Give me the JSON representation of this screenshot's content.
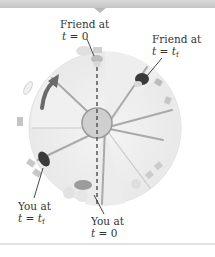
{
  "diagram": {
    "labels": {
      "friend_t0": {
        "line1": "Friend at",
        "line2_var": "t",
        "line2_eq": " = 0"
      },
      "friend_tf": {
        "line1": "Friend at",
        "line2_var": "t",
        "line2_eq": " = ",
        "line2_val": "t",
        "line2_sub": "f"
      },
      "you_tf": {
        "line1": "You at",
        "line2_var": "t",
        "line2_eq": " = ",
        "line2_val": "t",
        "line2_sub": "f"
      },
      "you_t0": {
        "line1": "You at",
        "line2_var": "t",
        "line2_eq": " = 0"
      }
    },
    "colors": {
      "platform": "#ededed",
      "spoke": "#a9a9a9",
      "hub": "#cfcfcf",
      "dashed_line": "#555555",
      "arrow": "#6a6a6a",
      "figure_dark": "#3a3a3a"
    },
    "rotation_direction": "clockwise"
  }
}
